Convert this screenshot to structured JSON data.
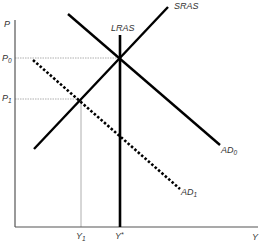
{
  "diagram": {
    "type": "AD-AS model",
    "axes": {
      "y_label": "P",
      "x_label": "Y",
      "y_ticks": [
        {
          "label": "P",
          "sub": "0"
        },
        {
          "label": "P",
          "sub": "1"
        }
      ],
      "x_ticks": [
        {
          "label": "Y",
          "sub": "1"
        },
        {
          "label": "Y",
          "sub": "*"
        }
      ]
    },
    "curves": {
      "lras": {
        "label": "LRAS",
        "style": "solid"
      },
      "sras": {
        "label": "SRAS",
        "style": "solid"
      },
      "ad0": {
        "label": "AD",
        "sub": "0",
        "style": "solid"
      },
      "ad1": {
        "label": "AD",
        "sub": "1",
        "style": "dotted"
      }
    },
    "colors": {
      "curve": "#000000",
      "guide": "#999999",
      "axis": "#555555",
      "text": "#333333"
    }
  }
}
